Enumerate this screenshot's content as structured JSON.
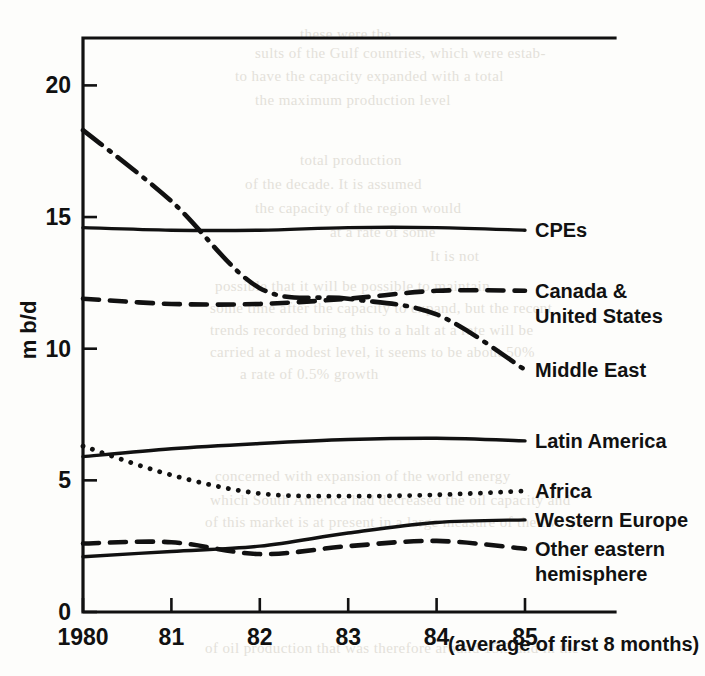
{
  "figure": {
    "background_color": "#fdfdfb",
    "ink_color": "#111111"
  },
  "axes": {
    "y_title": "m b/d",
    "y_ticks": [
      "0",
      "5",
      "10",
      "15",
      "20"
    ],
    "y_tick_values": [
      0,
      5,
      10,
      15,
      20
    ],
    "x_ticks": [
      "1980",
      "81",
      "82",
      "83",
      "84",
      "85"
    ],
    "x_tick_values": [
      1980,
      1981,
      1982,
      1983,
      1984,
      1985
    ],
    "x_note": "(average of first 8 months)"
  },
  "chart_data": {
    "type": "line",
    "title": "",
    "xlabel": "",
    "ylabel": "m b/d",
    "xlim": [
      1980,
      1985
    ],
    "ylim": [
      0,
      21.8
    ],
    "grid": false,
    "legend_position": "right-inline",
    "x": [
      1980,
      1981,
      1982,
      1983,
      1984,
      1985
    ],
    "series": [
      {
        "name": "Middle East",
        "style": "dash-dot",
        "label": "Middle East",
        "values": [
          18.3,
          15.6,
          12.3,
          11.9,
          11.3,
          9.2
        ]
      },
      {
        "name": "CPEs",
        "style": "solid",
        "label": "CPEs",
        "values": [
          14.6,
          14.5,
          14.5,
          14.6,
          14.6,
          14.5
        ]
      },
      {
        "name": "Canada & United States",
        "style": "dashed",
        "label": "Canada & United States",
        "label_line1": "Canada &",
        "label_line2": "United States",
        "values": [
          11.9,
          11.7,
          11.7,
          11.9,
          12.2,
          12.2
        ]
      },
      {
        "name": "Latin America",
        "style": "solid",
        "label": "Latin America",
        "values": [
          5.9,
          6.2,
          6.4,
          6.55,
          6.6,
          6.5
        ]
      },
      {
        "name": "Africa",
        "style": "dotted",
        "label": "Africa",
        "values": [
          6.3,
          5.2,
          4.5,
          4.4,
          4.45,
          4.6
        ]
      },
      {
        "name": "Western Europe",
        "style": "solid",
        "label": "Western Europe",
        "values": [
          2.1,
          2.3,
          2.5,
          3.0,
          3.4,
          3.5
        ]
      },
      {
        "name": "Other eastern hemisphere",
        "style": "dashed",
        "label": "Other eastern hemisphere",
        "label_line1": "Other eastern",
        "label_line2": "hemisphere",
        "values": [
          2.6,
          2.65,
          2.2,
          2.5,
          2.7,
          2.4
        ]
      }
    ]
  },
  "ghost_text": [
    {
      "text": "these were the",
      "x": 300,
      "y": 26
    },
    {
      "text": "sults of the Gulf countries, which were estab-",
      "x": 255,
      "y": 45
    },
    {
      "text": "to have the capacity expanded with a total",
      "x": 235,
      "y": 68
    },
    {
      "text": "the maximum production level",
      "x": 255,
      "y": 92
    },
    {
      "text": "total production",
      "x": 300,
      "y": 152
    },
    {
      "text": "of the decade. It is assumed",
      "x": 245,
      "y": 176
    },
    {
      "text": "the capacity of the region would",
      "x": 255,
      "y": 200
    },
    {
      "text": "at a rate of some",
      "x": 330,
      "y": 224
    },
    {
      "text": "It is not",
      "x": 430,
      "y": 248
    },
    {
      "text": "possible that it will be possible  to maintain",
      "x": 215,
      "y": 278
    },
    {
      "text": "some time after the capacity to expand, but the recent",
      "x": 210,
      "y": 300
    },
    {
      "text": "trends recorded bring this to a halt   at a rate  will be",
      "x": 210,
      "y": 322
    },
    {
      "text": "carried at a modest level, it seems to be   about 50%",
      "x": 210,
      "y": 344
    },
    {
      "text": "a rate of 0.5% growth",
      "x": 240,
      "y": 366
    },
    {
      "text": "concerned with expansion of the world energy",
      "x": 215,
      "y": 468
    },
    {
      "text": "which South America had decreased the oil capacity and",
      "x": 210,
      "y": 492
    },
    {
      "text": "of this market is at present in a large measure of the two yea",
      "x": 205,
      "y": 514
    },
    {
      "text": "of oil production that was therefore around 15.5 and in the",
      "x": 205,
      "y": 640
    }
  ]
}
